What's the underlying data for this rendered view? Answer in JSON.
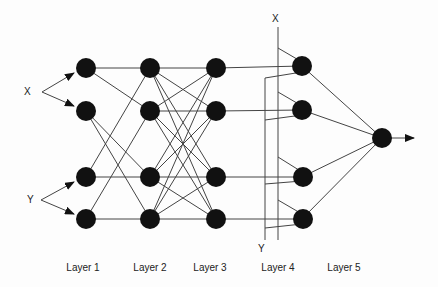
{
  "diagram": {
    "type": "neural-network",
    "inputs": {
      "x_label": "X",
      "y_label": "Y"
    },
    "layer4_bus": {
      "x_label": "X",
      "y_label": "Y"
    },
    "layers": [
      {
        "label": "Layer 1",
        "nodes": 4
      },
      {
        "label": "Layer 2",
        "nodes": 4
      },
      {
        "label": "Layer 3",
        "nodes": 4
      },
      {
        "label": "Layer 4",
        "nodes": 4
      },
      {
        "label": "Layer 5",
        "nodes": 1
      }
    ],
    "colors": {
      "node": "#111111",
      "edge": "#444444",
      "background": "#fdfdfd"
    }
  }
}
